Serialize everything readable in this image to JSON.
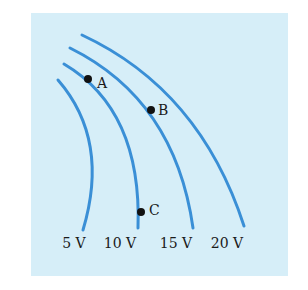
{
  "diagram": {
    "colors": {
      "background": "#d6eef8",
      "line": "#3a8fd6",
      "point": "#111111",
      "text": "#1a1a1a"
    },
    "equipotentials": [
      {
        "label": "5 V",
        "path": "M58 80 Q110 140 83 230",
        "label_pos": [
          74,
          248
        ]
      },
      {
        "label": "10 V",
        "path": "M64 64 Q142 110 138 228",
        "label_pos": [
          120,
          248
        ]
      },
      {
        "label": "15 V",
        "path": "M70 48 Q175 100 193 228",
        "label_pos": [
          176,
          248
        ]
      },
      {
        "label": "20 V",
        "path": "M82 35 Q200 90 244 226",
        "label_pos": [
          227,
          248
        ]
      }
    ],
    "points": [
      {
        "label": "A",
        "x": 88,
        "y": 79,
        "label_x": 97,
        "label_y": 84
      },
      {
        "label": "B",
        "x": 151,
        "y": 110,
        "label_x": 158,
        "label_y": 111
      },
      {
        "label": "C",
        "x": 141,
        "y": 212,
        "label_x": 149,
        "label_y": 211
      }
    ]
  }
}
